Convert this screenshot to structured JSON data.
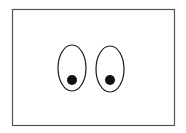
{
  "figure": {
    "frame": {
      "x": 12,
      "y": 10,
      "width": 162,
      "height": 115,
      "stroke": "#555555"
    },
    "eyes": [
      {
        "name": "left",
        "cx": 72,
        "cy": 68,
        "rx": 14,
        "ry": 23,
        "pupil": {
          "cx": 72,
          "cy": 80,
          "r": 5
        }
      },
      {
        "name": "right",
        "cx": 110,
        "cy": 68,
        "rx": 14,
        "ry": 23,
        "pupil": {
          "cx": 110,
          "cy": 80,
          "r": 5
        }
      }
    ],
    "colors": {
      "outline": "#1a1a1a",
      "pupil": "#111111",
      "background": "#ffffff"
    }
  }
}
